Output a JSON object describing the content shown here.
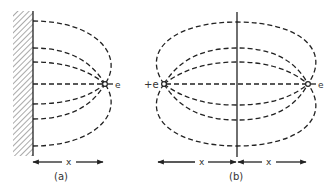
{
  "figure": {
    "panel_a": {
      "caption": "(a)",
      "charge_label": "e",
      "distance_label": "x",
      "description": "Point charge near a grounded conducting wall with field lines"
    },
    "panel_b": {
      "caption": "(b)",
      "left_charge_label": "+e",
      "right_charge_label": "e",
      "left_distance_label": "x",
      "right_distance_label": "x",
      "description": "Image-charge equivalent: two charges separated by mirror plane"
    }
  }
}
